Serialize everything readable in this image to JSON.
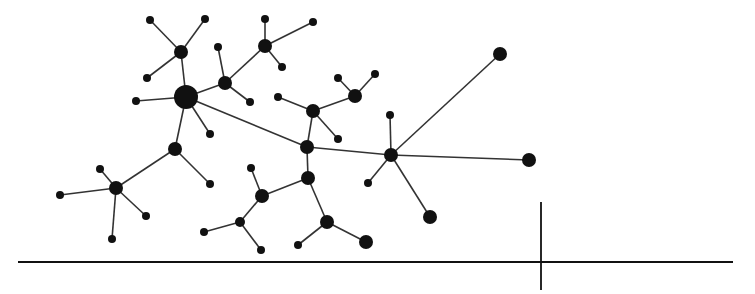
{
  "diagram": {
    "type": "network-graph",
    "colors": {
      "node": "#111111",
      "edge": "#333333",
      "axis": "#111111",
      "background": "#ffffff"
    },
    "nodes": [
      {
        "id": "A",
        "x": 186,
        "y": 97,
        "r": 12
      },
      {
        "id": "B",
        "x": 181,
        "y": 52,
        "r": 7
      },
      {
        "id": "B1",
        "x": 150,
        "y": 20,
        "r": 4
      },
      {
        "id": "B2",
        "x": 205,
        "y": 19,
        "r": 4
      },
      {
        "id": "B3",
        "x": 147,
        "y": 78,
        "r": 4
      },
      {
        "id": "C",
        "x": 225,
        "y": 83,
        "r": 7
      },
      {
        "id": "C1",
        "x": 218,
        "y": 47,
        "r": 4
      },
      {
        "id": "C2",
        "x": 250,
        "y": 102,
        "r": 4
      },
      {
        "id": "D",
        "x": 265,
        "y": 46,
        "r": 7
      },
      {
        "id": "D1",
        "x": 265,
        "y": 19,
        "r": 4
      },
      {
        "id": "D2",
        "x": 313,
        "y": 22,
        "r": 4
      },
      {
        "id": "D3",
        "x": 282,
        "y": 67,
        "r": 4
      },
      {
        "id": "A1",
        "x": 136,
        "y": 101,
        "r": 4
      },
      {
        "id": "A2",
        "x": 210,
        "y": 134,
        "r": 4
      },
      {
        "id": "E",
        "x": 175,
        "y": 149,
        "r": 7
      },
      {
        "id": "E1",
        "x": 210,
        "y": 184,
        "r": 4
      },
      {
        "id": "F",
        "x": 116,
        "y": 188,
        "r": 7
      },
      {
        "id": "F1",
        "x": 60,
        "y": 195,
        "r": 4
      },
      {
        "id": "F2",
        "x": 100,
        "y": 169,
        "r": 4
      },
      {
        "id": "F3",
        "x": 146,
        "y": 216,
        "r": 4
      },
      {
        "id": "F4",
        "x": 112,
        "y": 239,
        "r": 4
      },
      {
        "id": "G",
        "x": 307,
        "y": 147,
        "r": 7
      },
      {
        "id": "H",
        "x": 313,
        "y": 111,
        "r": 7
      },
      {
        "id": "H1",
        "x": 278,
        "y": 97,
        "r": 4
      },
      {
        "id": "H2",
        "x": 338,
        "y": 139,
        "r": 4
      },
      {
        "id": "I",
        "x": 355,
        "y": 96,
        "r": 7
      },
      {
        "id": "I1",
        "x": 338,
        "y": 78,
        "r": 4
      },
      {
        "id": "I2",
        "x": 375,
        "y": 74,
        "r": 4
      },
      {
        "id": "J",
        "x": 391,
        "y": 155,
        "r": 7
      },
      {
        "id": "J1",
        "x": 390,
        "y": 115,
        "r": 4
      },
      {
        "id": "J2",
        "x": 368,
        "y": 183,
        "r": 4
      },
      {
        "id": "K",
        "x": 500,
        "y": 54,
        "r": 7
      },
      {
        "id": "L",
        "x": 529,
        "y": 160,
        "r": 7
      },
      {
        "id": "M",
        "x": 430,
        "y": 217,
        "r": 7
      },
      {
        "id": "N",
        "x": 308,
        "y": 178,
        "r": 7
      },
      {
        "id": "O",
        "x": 262,
        "y": 196,
        "r": 7
      },
      {
        "id": "O1",
        "x": 251,
        "y": 168,
        "r": 4
      },
      {
        "id": "P",
        "x": 240,
        "y": 222,
        "r": 5
      },
      {
        "id": "P1",
        "x": 204,
        "y": 232,
        "r": 4
      },
      {
        "id": "P2",
        "x": 261,
        "y": 250,
        "r": 4
      },
      {
        "id": "Q",
        "x": 327,
        "y": 222,
        "r": 7
      },
      {
        "id": "Q1",
        "x": 298,
        "y": 245,
        "r": 4
      },
      {
        "id": "R",
        "x": 366,
        "y": 242,
        "r": 7
      }
    ],
    "edges": [
      [
        "A",
        "B"
      ],
      [
        "B",
        "B1"
      ],
      [
        "B",
        "B2"
      ],
      [
        "B",
        "B3"
      ],
      [
        "A",
        "C"
      ],
      [
        "C",
        "C1"
      ],
      [
        "C",
        "C2"
      ],
      [
        "C",
        "D"
      ],
      [
        "D",
        "D1"
      ],
      [
        "D",
        "D2"
      ],
      [
        "D",
        "D3"
      ],
      [
        "A",
        "A1"
      ],
      [
        "A",
        "A2"
      ],
      [
        "A",
        "E"
      ],
      [
        "E",
        "E1"
      ],
      [
        "E",
        "F"
      ],
      [
        "F",
        "F1"
      ],
      [
        "F",
        "F2"
      ],
      [
        "F",
        "F3"
      ],
      [
        "F",
        "F4"
      ],
      [
        "A",
        "G"
      ],
      [
        "G",
        "H"
      ],
      [
        "H",
        "H1"
      ],
      [
        "H",
        "H2"
      ],
      [
        "H",
        "I"
      ],
      [
        "I",
        "I1"
      ],
      [
        "I",
        "I2"
      ],
      [
        "G",
        "J"
      ],
      [
        "J",
        "J1"
      ],
      [
        "J",
        "J2"
      ],
      [
        "J",
        "K"
      ],
      [
        "J",
        "L"
      ],
      [
        "J",
        "M"
      ],
      [
        "G",
        "N"
      ],
      [
        "N",
        "O"
      ],
      [
        "O",
        "O1"
      ],
      [
        "O",
        "P"
      ],
      [
        "P",
        "P1"
      ],
      [
        "P",
        "P2"
      ],
      [
        "N",
        "Q"
      ],
      [
        "Q",
        "Q1"
      ],
      [
        "Q",
        "R"
      ]
    ],
    "baseline": {
      "x1": 18,
      "y": 262,
      "x2": 733
    },
    "tick": {
      "x": 541,
      "y1": 202,
      "y2": 290
    }
  }
}
